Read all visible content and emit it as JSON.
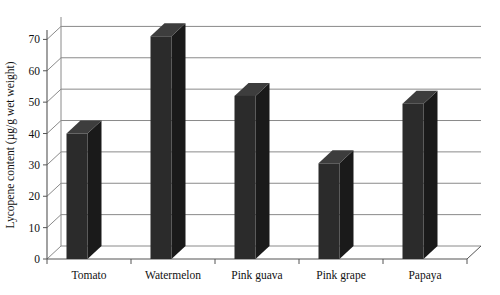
{
  "chart_data": {
    "type": "bar",
    "title": "",
    "subtitle": "",
    "xlabel": "",
    "ylabel": "Lycopene content (µg/g wet weight)",
    "categories": [
      "Tomato",
      "Watermelon",
      "Pink guava",
      "Pink grape",
      "Papaya"
    ],
    "values": [
      40,
      71,
      52,
      30.5,
      49.5
    ],
    "ylim": [
      0,
      73
    ],
    "yticks": [
      0,
      10,
      20,
      30,
      40,
      50,
      60,
      70
    ],
    "ytick_labels": [
      "0",
      "10",
      "20",
      "30",
      "40",
      "50",
      "60",
      "70"
    ],
    "grid": true,
    "grid_axis": "y",
    "legend": false,
    "legend_position": "none",
    "style": "3d-perspective",
    "bar_color": "#2b2b2b",
    "bar_side_color": "#1a1a1a",
    "bar_top_color": "#3d3d3d",
    "grid_color": "#8a8a8a",
    "axis_color": "#555555",
    "background_color": "#ffffff"
  }
}
